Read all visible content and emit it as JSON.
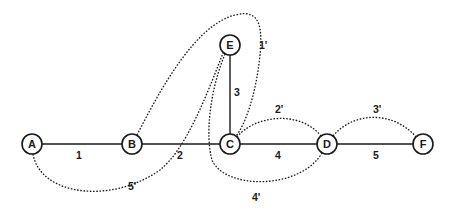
{
  "diagram": {
    "type": "graph-with-spanning-tree-and-chords",
    "nodes": [
      {
        "id": "A",
        "label": "A",
        "x": 32,
        "y": 144
      },
      {
        "id": "B",
        "label": "B",
        "x": 132,
        "y": 144
      },
      {
        "id": "C",
        "label": "C",
        "x": 230,
        "y": 144
      },
      {
        "id": "D",
        "label": "D",
        "x": 327,
        "y": 144
      },
      {
        "id": "E",
        "label": "E",
        "x": 230,
        "y": 45
      },
      {
        "id": "F",
        "label": "F",
        "x": 423,
        "y": 144
      }
    ],
    "tree_edges": [
      {
        "id": "1",
        "label": "1",
        "from": "A",
        "to": "B"
      },
      {
        "id": "2",
        "label": "2",
        "from": "B",
        "to": "C"
      },
      {
        "id": "3",
        "label": "3",
        "from": "E",
        "to": "C"
      },
      {
        "id": "4",
        "label": "4",
        "from": "C",
        "to": "D"
      },
      {
        "id": "5",
        "label": "5",
        "from": "D",
        "to": "F"
      }
    ],
    "chords": [
      {
        "id": "1'",
        "label": "1'",
        "from": "B",
        "to": "C",
        "style": "dotted",
        "route": "loop around E"
      },
      {
        "id": "2'",
        "label": "2'",
        "from": "C",
        "to": "D",
        "style": "dotted",
        "route": "arc above"
      },
      {
        "id": "3'",
        "label": "3'",
        "from": "D",
        "to": "F",
        "style": "dotted",
        "route": "arc above"
      },
      {
        "id": "4'",
        "label": "4'",
        "from": "E",
        "to": "D",
        "style": "dotted",
        "route": "loop below C"
      },
      {
        "id": "5'",
        "label": "5'",
        "from": "A",
        "to": "E",
        "style": "dotted",
        "route": "arc below B"
      }
    ]
  }
}
